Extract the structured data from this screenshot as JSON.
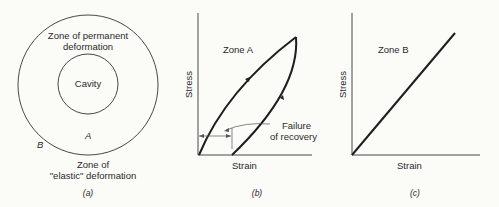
{
  "panels": {
    "a": {
      "caption": "(a)",
      "outer_label_line1": "Zone of permanent",
      "outer_label_line2": "deformation",
      "cavity_label": "Cavity",
      "zone_a_marker": "A",
      "zone_b_marker": "B",
      "bottom_label_line1": "Zone of",
      "bottom_label_line2": "\"elastic\" deformation"
    },
    "b": {
      "caption": "(b)",
      "zone_label": "Zone A",
      "y_axis_label": "Stress",
      "x_axis_label": "Strain",
      "annotation_line1": "Failure",
      "annotation_line2": "of recovery"
    },
    "c": {
      "caption": "(c)",
      "zone_label": "Zone B",
      "y_axis_label": "Stress",
      "x_axis_label": "Strain"
    }
  },
  "colors": {
    "background": "#fbfbf8",
    "ink": "#1e1e1e"
  }
}
